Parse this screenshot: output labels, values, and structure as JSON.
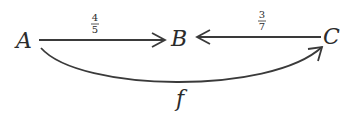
{
  "diagram": {
    "type": "commutative-diagram",
    "nodes": [
      {
        "id": "A",
        "label": "A"
      },
      {
        "id": "B",
        "label": "B"
      },
      {
        "id": "C",
        "label": "C"
      }
    ],
    "edges": [
      {
        "from": "A",
        "to": "B",
        "label_num": "4",
        "label_den": "5",
        "style": "straight"
      },
      {
        "from": "C",
        "to": "B",
        "label_num": "3",
        "label_den": "7",
        "style": "straight"
      },
      {
        "from": "A",
        "to": "C",
        "label": "f",
        "style": "curved-below"
      }
    ],
    "colors": {
      "ink": "#2b2b2b",
      "background": "#ffffff"
    }
  }
}
